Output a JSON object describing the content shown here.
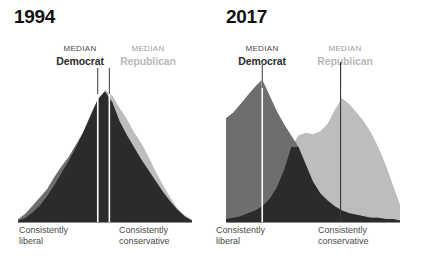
{
  "figure": {
    "background_color": "#ffffff",
    "democrat_color": "#6e6e6e",
    "republican_color": "#bdbdbd",
    "overlap_color": "#2b2b2b",
    "median_line_color_left": "#ffffff",
    "median_line_color_right": "#333333",
    "baseline_color": "#8c8c8c"
  },
  "panels": [
    {
      "id": "1994",
      "year": "1994",
      "median_democrat": {
        "kicker": "MEDIAN",
        "party": "Democrat"
      },
      "median_republican": {
        "kicker": "MEDIAN",
        "party": "Republican"
      },
      "axis_left": "Consistently\nliberal",
      "axis_left_line1": "Consistently",
      "axis_left_line2": "liberal",
      "axis_right_line1": "Consistently",
      "axis_right_line2": "conservative"
    },
    {
      "id": "2017",
      "year": "2017",
      "median_democrat": {
        "kicker": "MEDIAN",
        "party": "Democrat"
      },
      "median_republican": {
        "kicker": "MEDIAN",
        "party": "Republican"
      },
      "axis_left_line1": "Consistently",
      "axis_left_line2": "liberal",
      "axis_right_line1": "Consistently",
      "axis_right_line2": "conservative"
    }
  ],
  "chart_data": [
    {
      "type": "area",
      "title": "1994",
      "xlabel": "Ideological consistency (consistently liberal → consistently conservative)",
      "ylabel": "Distribution of respondents",
      "grid": false,
      "legend_position": "above-plot",
      "annotations": [
        "MEDIAN Democrat",
        "MEDIAN Republican",
        "Consistently liberal",
        "Consistently conservative"
      ],
      "x": [
        0,
        1,
        2,
        3,
        4,
        5,
        6,
        7,
        8,
        9,
        10,
        11,
        12,
        13,
        14,
        15,
        16,
        17,
        18,
        19,
        20,
        21,
        22,
        23,
        24
      ],
      "xlim": [
        0,
        24
      ],
      "ylim": [
        0,
        100
      ],
      "median_democrat_x": 11.0,
      "median_republican_x": 12.6,
      "series": [
        {
          "name": "Democrat",
          "color": "#6e6e6e",
          "values": [
            2,
            6,
            12,
            18,
            24,
            33,
            41,
            48,
            57,
            66,
            78,
            90,
            96,
            88,
            74,
            64,
            55,
            46,
            38,
            30,
            22,
            15,
            9,
            4,
            1
          ]
        },
        {
          "name": "Republican",
          "color": "#bdbdbd",
          "values": [
            1,
            3,
            7,
            12,
            19,
            27,
            36,
            45,
            55,
            66,
            79,
            90,
            97,
            93,
            84,
            76,
            66,
            58,
            48,
            37,
            27,
            18,
            10,
            5,
            2
          ]
        }
      ]
    },
    {
      "type": "area",
      "title": "2017",
      "xlabel": "Ideological consistency (consistently liberal → consistently conservative)",
      "ylabel": "Distribution of respondents",
      "grid": false,
      "legend_position": "above-plot",
      "annotations": [
        "MEDIAN Democrat",
        "MEDIAN Republican",
        "Consistently liberal",
        "Consistently conservative"
      ],
      "x": [
        0,
        1,
        2,
        3,
        4,
        5,
        6,
        7,
        8,
        9,
        10,
        11,
        12,
        13,
        14,
        15,
        16,
        17,
        18,
        19,
        20,
        21,
        22,
        23,
        24
      ],
      "xlim": [
        0,
        24
      ],
      "ylim": [
        0,
        100
      ],
      "median_democrat_x": 5.0,
      "median_republican_x": 15.8,
      "series": [
        {
          "name": "Democrat",
          "color": "#6e6e6e",
          "values": [
            72,
            76,
            82,
            88,
            94,
            99,
            88,
            77,
            68,
            60,
            52,
            40,
            28,
            20,
            15,
            11,
            8,
            6,
            5,
            4,
            3,
            3,
            2,
            2,
            1
          ]
        },
        {
          "name": "Republican",
          "color": "#bdbdbd",
          "values": [
            2,
            3,
            4,
            6,
            8,
            11,
            16,
            24,
            36,
            52,
            60,
            62,
            61,
            63,
            68,
            78,
            86,
            82,
            76,
            70,
            62,
            52,
            40,
            26,
            12
          ]
        }
      ]
    }
  ]
}
